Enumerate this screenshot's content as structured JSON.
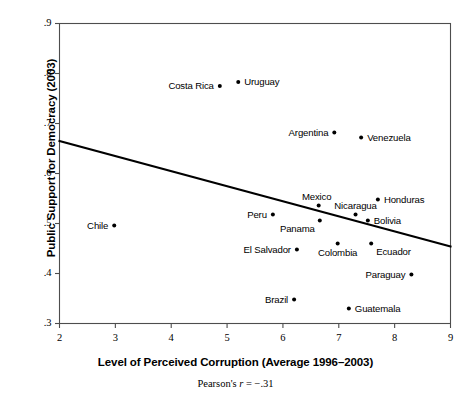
{
  "chart_data": {
    "type": "scatter",
    "title": "",
    "xlabel": "Level of Perceived Corruption (Average 1996–2003)",
    "ylabel": "Public Support for Democracy (2003)",
    "caption": "Pearson's r = −.31",
    "caption_prefix": "Pearson's ",
    "caption_stat": "r",
    "caption_value": " = −.31",
    "xlim": [
      2,
      9
    ],
    "ylim": [
      0.3,
      0.9
    ],
    "xticks": [
      "2",
      "3",
      "4",
      "5",
      "6",
      "7",
      "8",
      "9"
    ],
    "xtick_values": [
      2,
      3,
      4,
      5,
      6,
      7,
      8,
      9
    ],
    "yticks": [
      ".9",
      ".8",
      ".7",
      ".6",
      ".5",
      ".4",
      ".3"
    ],
    "ytick_values": [
      0.9,
      0.8,
      0.7,
      0.6,
      0.5,
      0.4,
      0.3
    ],
    "grid": false,
    "legend": "none",
    "points": [
      {
        "label": "Costa Rica",
        "x": 4.87,
        "y": 0.775,
        "label_side": "left"
      },
      {
        "label": "Uruguay",
        "x": 5.2,
        "y": 0.783,
        "label_side": "right"
      },
      {
        "label": "Argentina",
        "x": 6.92,
        "y": 0.682,
        "label_side": "left"
      },
      {
        "label": "Venezuela",
        "x": 7.4,
        "y": 0.672,
        "label_side": "right"
      },
      {
        "label": "Mexico",
        "x": 6.64,
        "y": 0.536,
        "label_side": "above-left"
      },
      {
        "label": "Honduras",
        "x": 7.7,
        "y": 0.548,
        "label_side": "right"
      },
      {
        "label": "Nicaragua",
        "x": 7.3,
        "y": 0.518,
        "label_side": "above"
      },
      {
        "label": "Bolivia",
        "x": 7.52,
        "y": 0.506,
        "label_side": "right"
      },
      {
        "label": "Peru",
        "x": 5.82,
        "y": 0.518,
        "label_side": "left"
      },
      {
        "label": "Panama",
        "x": 6.66,
        "y": 0.506,
        "label_side": "below-left"
      },
      {
        "label": "Chile",
        "x": 2.98,
        "y": 0.496,
        "label_side": "left"
      },
      {
        "label": "El Salvador",
        "x": 6.25,
        "y": 0.448,
        "label_side": "left"
      },
      {
        "label": "Colombia",
        "x": 6.98,
        "y": 0.46,
        "label_side": "below"
      },
      {
        "label": "Ecuador",
        "x": 7.58,
        "y": 0.46,
        "label_side": "below-right"
      },
      {
        "label": "Paraguay",
        "x": 8.3,
        "y": 0.398,
        "label_side": "left"
      },
      {
        "label": "Brazil",
        "x": 6.2,
        "y": 0.348,
        "label_side": "left"
      },
      {
        "label": "Guatemala",
        "x": 7.18,
        "y": 0.33,
        "label_side": "right"
      }
    ],
    "trendline": {
      "x1": 2.0,
      "y1": 0.665,
      "x2": 9.0,
      "y2": 0.454,
      "color": "#000000"
    },
    "point_color": "#000000",
    "axis_color": "#4d4d4d"
  }
}
